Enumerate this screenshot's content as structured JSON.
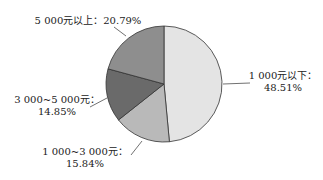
{
  "chart_data": {
    "type": "pie",
    "title": "",
    "start": "12 o'clock",
    "direction": "clockwise",
    "slices": [
      {
        "label": "1 000元以下",
        "value": 48.51,
        "value_text": "48.51%",
        "color": "#e4e4e4"
      },
      {
        "label": "1 000~3 000元",
        "value": 15.84,
        "value_text": "15.84%",
        "color": "#b9b9b9"
      },
      {
        "label": "3 000~5 000元",
        "value": 14.85,
        "value_text": "14.85%",
        "color": "#6a6a6a"
      },
      {
        "label": "5 000元以上",
        "value": 20.79,
        "value_text": "20.79%",
        "color": "#8e8e8e"
      }
    ],
    "label_separator": "：",
    "legend": "none"
  }
}
